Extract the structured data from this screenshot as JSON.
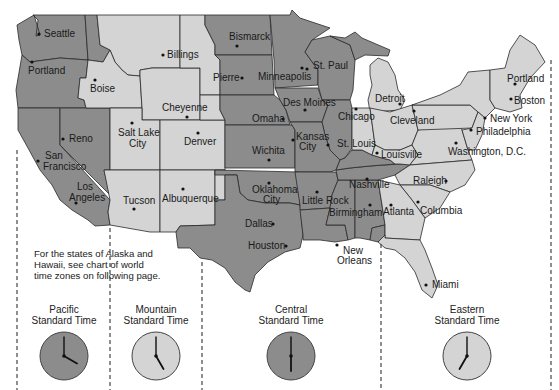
{
  "note": "For the states of Alaska and Hawaii, see chart of world time zones on following page.",
  "colors": {
    "pacific": "#8c8c8c",
    "mountain": "#d4d4d4",
    "central": "#8c8c8c",
    "eastern": "#d4d4d4"
  },
  "zones": [
    {
      "id": "pacific",
      "line1": "Pacific",
      "line2": "Standard Time",
      "clock": {
        "hour": 4,
        "minute": 0
      },
      "shade": "dark"
    },
    {
      "id": "mountain",
      "line1": "Mountain",
      "line2": "Standard Time",
      "clock": {
        "hour": 5,
        "minute": 0
      },
      "shade": "light"
    },
    {
      "id": "central",
      "line1": "Central",
      "line2": "Standard Time",
      "clock": {
        "hour": 6,
        "minute": 0
      },
      "shade": "dark"
    },
    {
      "id": "eastern",
      "line1": "Eastern",
      "line2": "Standard Time",
      "clock": {
        "hour": 7,
        "minute": 0
      },
      "shade": "light"
    }
  ],
  "cities": {
    "seattle": "Seattle",
    "portland_or": "Portland",
    "boise": "Boise",
    "billings": "Billings",
    "bismarck": "Bismarck",
    "pierre": "Pierre",
    "minneapolis": "Minneapolis",
    "st_paul": "St. Paul",
    "cheyenne": "Cheyenne",
    "reno": "Reno",
    "salt_lake_1": "Salt Lake",
    "salt_lake_2": "City",
    "denver": "Denver",
    "san_francisco_1": "San",
    "san_francisco_2": "Francisco",
    "los_angeles_1": "Los",
    "los_angeles_2": "Angeles",
    "tucson": "Tucson",
    "albuquerque": "Albuquerque",
    "des_moines": "Des Moines",
    "omaha": "Omaha",
    "chicago": "Chicago",
    "kansas_city_1": "Kansas",
    "kansas_city_2": "City",
    "st_louis": "St. Louis",
    "wichita": "Wichita",
    "oklahoma_city_1": "Oklahoma",
    "oklahoma_city_2": "City",
    "little_rock": "Little Rock",
    "dallas": "Dallas",
    "houston": "Houston",
    "nashville": "Nashville",
    "birmingham": "Birmingham",
    "new_orleans_1": "New",
    "new_orleans_2": "Orleans",
    "detroit": "Detroit",
    "cleveland": "Cleveland",
    "louisville": "Louisville",
    "portland_me": "Portland",
    "boston": "Boston",
    "new_york": "New York",
    "philadelphia": "Philadelphia",
    "washington_dc": "Washington, D.C.",
    "raleigh": "Raleigh",
    "atlanta": "Atlanta",
    "columbia": "Columbia",
    "miami": "Miami"
  }
}
